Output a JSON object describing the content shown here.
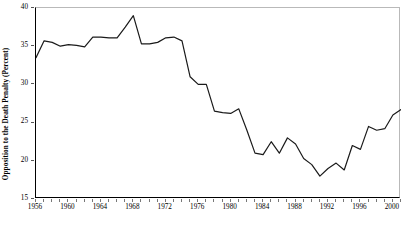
{
  "chart_data": {
    "type": "line",
    "title": "",
    "xlabel": "",
    "ylabel": "Opposition to the Death Penalty (Percent)",
    "xlim": [
      1956,
      2001
    ],
    "ylim": [
      15,
      40
    ],
    "ytick_values": [
      15,
      20,
      25,
      30,
      35,
      40
    ],
    "ytick_labels": [
      "15",
      "20",
      "25",
      "30",
      "35",
      "40"
    ],
    "xtick_labels": [
      "1956",
      "1960",
      "1964",
      "1968",
      "1972",
      "1976",
      "1980",
      "1984",
      "1988",
      "1992",
      "1996",
      "2000"
    ],
    "xtick_values": [
      1956,
      1960,
      1964,
      1968,
      1972,
      1976,
      1980,
      1984,
      1988,
      1992,
      1996,
      2000
    ],
    "xtick_minor_step": 1,
    "grid": false,
    "legend": "none",
    "line_color": "#1a1a1a",
    "line_width": 1.2,
    "x": [
      1956,
      1957,
      1958,
      1959,
      1960,
      1961,
      1962,
      1963,
      1964,
      1965,
      1966,
      1967,
      1968,
      1969,
      1970,
      1971,
      1972,
      1973,
      1974,
      1975,
      1976,
      1977,
      1978,
      1979,
      1980,
      1981,
      1982,
      1983,
      1984,
      1985,
      1986,
      1987,
      1988,
      1989,
      1990,
      1991,
      1992,
      1993,
      1994,
      1995,
      1996,
      1997,
      1998,
      1999,
      2000,
      2001
    ],
    "y": [
      33.5,
      35.7,
      35.5,
      35.0,
      35.2,
      35.1,
      34.9,
      36.2,
      36.2,
      36.1,
      36.1,
      37.5,
      39.0,
      35.3,
      35.3,
      35.5,
      36.1,
      36.2,
      35.7,
      31.0,
      30.0,
      30.0,
      26.5,
      26.3,
      26.2,
      26.8,
      24.0,
      21.0,
      20.8,
      22.5,
      21.0,
      23.0,
      22.2,
      20.3,
      19.5,
      18.0,
      19.0,
      19.7,
      18.8,
      22.0,
      21.5,
      24.5,
      24.0,
      24.2,
      26.0,
      26.7
    ]
  },
  "axes": {
    "yaxis_title": "Opposition to the Death Penalty (Percent)"
  }
}
